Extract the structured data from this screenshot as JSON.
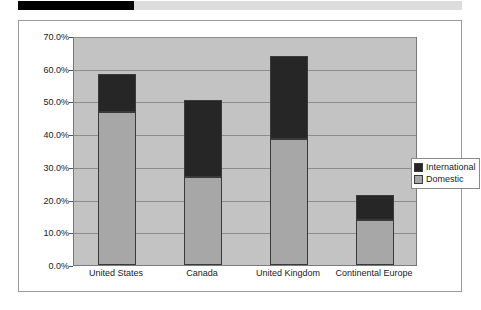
{
  "banner": {
    "dark_segment_color": "#000000",
    "light_segment_color": "#dcdcdc"
  },
  "chart_data": {
    "type": "bar",
    "stacked": true,
    "title": "",
    "subtitle": "",
    "xlabel": "",
    "ylabel": "",
    "categories": [
      "United States",
      "Canada",
      "United Kingdom",
      "Continental Europe"
    ],
    "series": [
      {
        "name": "Domestic",
        "color": "#a7a7a7",
        "values": [
          46.8,
          26.8,
          38.6,
          13.8
        ]
      },
      {
        "name": "International",
        "color": "#262626",
        "values": [
          11.5,
          23.7,
          25.4,
          7.7
        ]
      }
    ],
    "totals": [
      58.3,
      50.5,
      64.0,
      21.5
    ],
    "ylim": [
      0,
      70
    ],
    "ytick_values": [
      0,
      10,
      20,
      30,
      40,
      50,
      60,
      70
    ],
    "ytick_labels": [
      "0.0%",
      "10.0%",
      "20.0%",
      "30.0%",
      "40.0%",
      "50.0%",
      "60.0%",
      "70.0%"
    ],
    "grid": true,
    "grid_axis": "y",
    "legend_position": "right",
    "legend_entries": [
      {
        "label": "International",
        "color": "#262626"
      },
      {
        "label": "Domestic",
        "color": "#a7a7a7"
      }
    ],
    "plot_background": "#c3c3c3",
    "figure_background": "#ffffff"
  }
}
